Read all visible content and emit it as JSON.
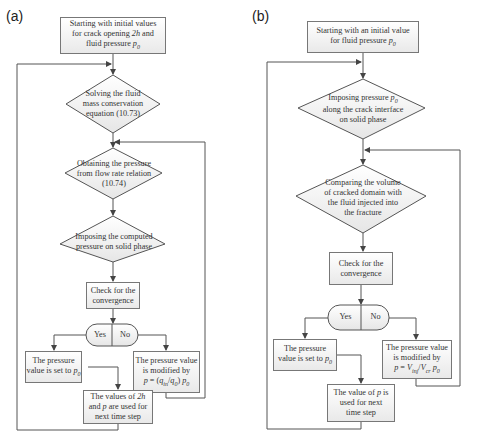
{
  "panels": [
    {
      "label": "(a)",
      "start": "Starting with initial values for crack opening 2h and fluid pressure p0",
      "step1": "Solving the fluid mass conservation equation (10.73)",
      "step2": "Obtaining the pressure from flow rate relation (10.74)",
      "step3": "Imposing the computed pressure on solid phase",
      "check": "Check for the convergence",
      "yes": "Yes",
      "no": "No",
      "yes_result": "The pressure value is set to p0",
      "no_result": "The pressure value is modified by p = (q_in/q_0) p0",
      "final": "The values of 2h and p are used for next time step"
    },
    {
      "label": "(b)",
      "start": "Starting with an initial value for fluid pressure p0",
      "step1": "Imposing pressure p0 along the crack interface on solid phase",
      "step2": "Comparing the volume of cracked domain with the fluid injected into the fracture",
      "check": "Check for the convergence",
      "yes": "Yes",
      "no": "No",
      "yes_result": "The pressure value is set to p0",
      "no_result": "The pressure value is modified by p = V_inj/V_cr p0",
      "final": "The value of p is used for next time step"
    }
  ]
}
